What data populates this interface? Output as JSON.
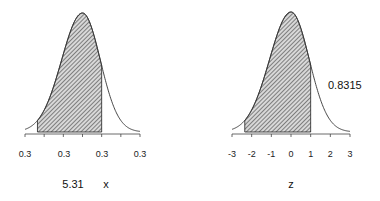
{
  "chart_data": [
    {
      "type": "area",
      "title": "",
      "xlabel": "x",
      "ylabel": "",
      "value_label": "5.31",
      "distribution": "normal",
      "x_tick_labels": [
        "0.3",
        "0.3",
        "0.3",
        "0.3"
      ],
      "shaded_region": {
        "from_tick_fraction": 0.105,
        "to_tick_fraction": 0.667
      },
      "hatch": true,
      "grid": false
    },
    {
      "type": "area",
      "title": "",
      "xlabel": "z",
      "ylabel": "",
      "annotation": "0.8315",
      "distribution": "standard normal",
      "x_ticks": [
        -3,
        -2,
        -1,
        0,
        1,
        2,
        3
      ],
      "x_tick_labels": [
        "-3",
        "-2",
        "-1",
        "0",
        "1",
        "2",
        "3"
      ],
      "xlim": [
        -3,
        3
      ],
      "shaded_region": {
        "from": -2.35,
        "to": 1.0
      },
      "shaded_area": 0.8315,
      "hatch": true,
      "grid": false
    }
  ],
  "left": {
    "ticks": [
      "0.3",
      "0.3",
      "0.3",
      "0.3"
    ],
    "value_label": "5.31",
    "axis_label": "x"
  },
  "right": {
    "ticks": [
      "-3",
      "-2",
      "-1",
      "0",
      "1",
      "2",
      "3"
    ],
    "area_label": "0.8315",
    "axis_label": "z"
  }
}
